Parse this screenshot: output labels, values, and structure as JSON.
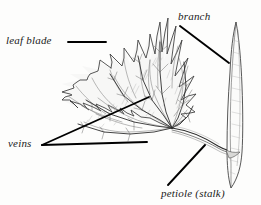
{
  "figure": {
    "kind": "botanical-line-drawing",
    "background_color": "#fdfdfc",
    "ink_color": "#222222",
    "shading_color": "#9a9a9a",
    "leader_color": "#000000"
  },
  "labels": {
    "leaf_blade": "leaf blade",
    "branch": "branch",
    "veins": "veins",
    "petiole": "petiole (stalk)"
  },
  "leaders": {
    "leaf_blade": {
      "x1": 68,
      "y1": 42,
      "x2": 106,
      "y2": 42
    },
    "branch": {
      "x1": 180,
      "y1": 26,
      "x2": 229,
      "y2": 63
    },
    "veins_upper": {
      "x1": 42,
      "y1": 145,
      "x2": 149,
      "y2": 97
    },
    "veins_lower": {
      "x1": 42,
      "y1": 145,
      "x2": 147,
      "y2": 142
    },
    "petiole": {
      "x1": 168,
      "y1": 185,
      "x2": 205,
      "y2": 145
    }
  },
  "anatomy": {
    "leaf_base": {
      "x": 172,
      "y": 128
    },
    "branch_top": {
      "x": 236,
      "y": 22
    },
    "branch_bottom": {
      "x": 231,
      "y": 188
    },
    "petiole_join": {
      "x": 229,
      "y": 150
    }
  }
}
